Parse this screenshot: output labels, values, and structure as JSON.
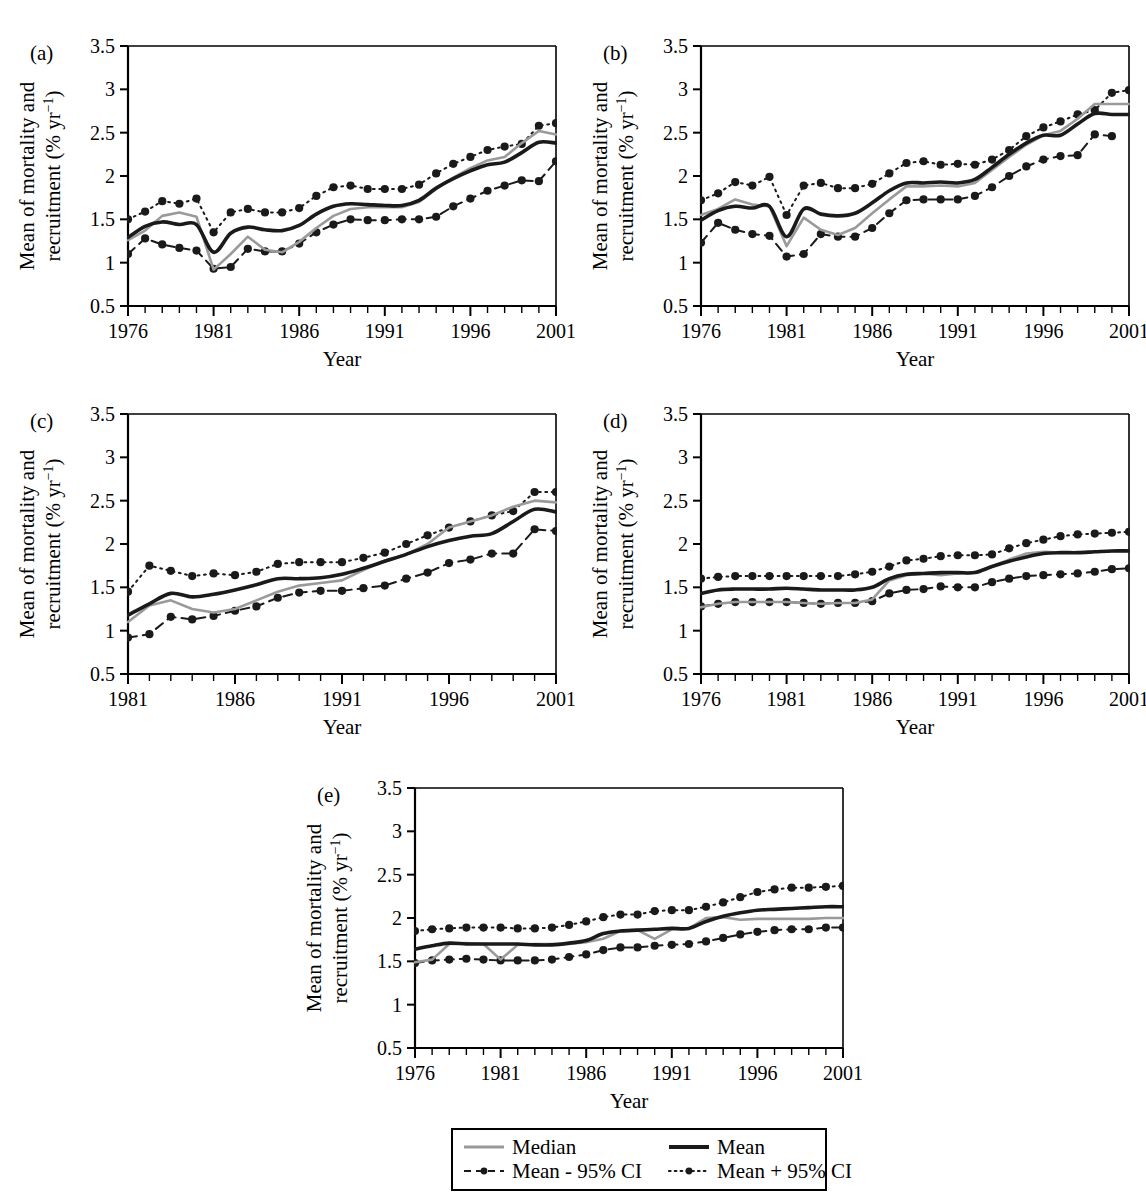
{
  "figure": {
    "axis_titles": {
      "x": "Year",
      "y_line1": "Mean of mortality and",
      "y_line2": "recruitment (% yr",
      "y_sup": "−1",
      "y_close": ")"
    },
    "colors": {
      "mean": "#1a1a1a",
      "median": "#9a9a9a",
      "ci_lower": "#1a1a1a",
      "ci_upper": "#1a1a1a",
      "axis": "#000000",
      "background": "#ffffff"
    },
    "legend": {
      "entries": [
        {
          "label": "Median",
          "style": "solid-gray",
          "marker": "none",
          "color": "#9a9a9a"
        },
        {
          "label": "Mean",
          "style": "solid-black",
          "marker": "none",
          "color": "#1a1a1a"
        },
        {
          "label": "Mean - 95% CI",
          "style": "dashed",
          "marker": "dot",
          "color": "#1a1a1a"
        },
        {
          "label": "Mean + 95% CI",
          "style": "dotted",
          "marker": "dot",
          "color": "#1a1a1a"
        }
      ]
    },
    "y_ticks": [
      0.5,
      1,
      1.5,
      2,
      2.5,
      3,
      3.5
    ],
    "y_tick_labels": [
      "0.5",
      "1",
      "1.5",
      "2",
      "2.5",
      "3",
      "3.5"
    ]
  },
  "chart_data": [
    {
      "id": "a",
      "panel_label": "(a)",
      "type": "line",
      "title": "",
      "xlabel": "Year",
      "ylabel": "Mean of mortality and recruitment (% yr−1)",
      "xlim": [
        1976,
        2001
      ],
      "ylim": [
        0.5,
        3.5
      ],
      "x_tick_labels": [
        "1976",
        "1981",
        "1986",
        "1991",
        "1996",
        "2001"
      ],
      "x_tick_values": [
        1976,
        1981,
        1986,
        1991,
        1996,
        2001
      ],
      "grid": false,
      "legend_position": "figure-bottom",
      "x": [
        1976,
        1977,
        1978,
        1979,
        1980,
        1981,
        1982,
        1983,
        1984,
        1985,
        1986,
        1987,
        1988,
        1989,
        1990,
        1991,
        1992,
        1993,
        1994,
        1995,
        1996,
        1997,
        1998,
        1999,
        2000,
        2001
      ],
      "series": [
        {
          "name": "Mean",
          "style": "solid-black",
          "values": [
            1.29,
            1.42,
            1.47,
            1.44,
            1.44,
            1.12,
            1.34,
            1.41,
            1.38,
            1.37,
            1.43,
            1.56,
            1.65,
            1.68,
            1.67,
            1.66,
            1.66,
            1.72,
            1.86,
            1.97,
            2.06,
            2.13,
            2.16,
            2.27,
            2.39,
            2.38
          ]
        },
        {
          "name": "Median",
          "style": "solid-gray",
          "values": [
            1.26,
            1.37,
            1.54,
            1.58,
            1.53,
            0.92,
            1.1,
            1.3,
            1.15,
            1.12,
            1.24,
            1.4,
            1.54,
            1.62,
            1.64,
            1.64,
            1.64,
            1.7,
            1.85,
            1.98,
            2.09,
            2.18,
            2.22,
            2.38,
            2.52,
            2.48
          ]
        },
        {
          "name": "Mean - 95% CI",
          "style": "dashed",
          "marker": "dot",
          "values": [
            1.1,
            1.28,
            1.21,
            1.17,
            1.14,
            0.93,
            0.95,
            1.16,
            1.13,
            1.13,
            1.22,
            1.35,
            1.44,
            1.5,
            1.49,
            1.49,
            1.5,
            1.5,
            1.53,
            1.65,
            1.74,
            1.83,
            1.89,
            1.95,
            1.94,
            2.17,
            2.17
          ]
        },
        {
          "name": "Mean + 95% CI",
          "style": "dotted",
          "marker": "dot",
          "values": [
            1.5,
            1.59,
            1.71,
            1.68,
            1.74,
            1.35,
            1.58,
            1.62,
            1.58,
            1.58,
            1.63,
            1.77,
            1.87,
            1.89,
            1.85,
            1.85,
            1.85,
            1.9,
            2.03,
            2.14,
            2.22,
            2.3,
            2.34,
            2.37,
            2.58,
            2.61
          ]
        }
      ]
    },
    {
      "id": "b",
      "panel_label": "(b)",
      "type": "line",
      "title": "",
      "xlabel": "Year",
      "ylabel": "Mean of mortality and recruitment (% yr−1)",
      "xlim": [
        1976,
        2001
      ],
      "ylim": [
        0.5,
        3.5
      ],
      "x_tick_labels": [
        "1976",
        "1981",
        "1986",
        "1991",
        "1996",
        "2001"
      ],
      "x_tick_values": [
        1976,
        1981,
        1986,
        1991,
        1996,
        2001
      ],
      "grid": false,
      "legend_position": "figure-bottom",
      "x": [
        1976,
        1977,
        1978,
        1979,
        1980,
        1981,
        1982,
        1983,
        1984,
        1985,
        1986,
        1987,
        1988,
        1989,
        1990,
        1991,
        1992,
        1993,
        1994,
        1995,
        1996,
        1997,
        1998,
        1999,
        2000,
        2001
      ],
      "series": [
        {
          "name": "Mean",
          "style": "solid-black",
          "values": [
            1.49,
            1.6,
            1.65,
            1.63,
            1.65,
            1.3,
            1.62,
            1.56,
            1.54,
            1.57,
            1.69,
            1.83,
            1.92,
            1.92,
            1.93,
            1.92,
            1.96,
            2.1,
            2.25,
            2.38,
            2.47,
            2.47,
            2.6,
            2.72,
            2.71,
            2.71
          ]
        },
        {
          "name": "Median",
          "style": "solid-gray",
          "values": [
            1.55,
            1.62,
            1.73,
            1.67,
            1.65,
            1.19,
            1.52,
            1.38,
            1.32,
            1.4,
            1.57,
            1.73,
            1.88,
            1.88,
            1.89,
            1.88,
            1.92,
            2.07,
            2.22,
            2.36,
            2.47,
            2.52,
            2.66,
            2.83,
            2.83,
            2.83
          ]
        },
        {
          "name": "Mean - 95% CI",
          "style": "dashed",
          "marker": "dot",
          "values": [
            1.23,
            1.46,
            1.38,
            1.33,
            1.31,
            1.07,
            1.1,
            1.33,
            1.3,
            1.3,
            1.4,
            1.57,
            1.72,
            1.73,
            1.73,
            1.73,
            1.77,
            1.87,
            2.0,
            2.11,
            2.19,
            2.23,
            2.24,
            2.48,
            2.46
          ]
        },
        {
          "name": "Mean + 95% CI",
          "style": "dotted",
          "marker": "dot",
          "values": [
            1.72,
            1.8,
            1.93,
            1.89,
            1.99,
            1.55,
            1.89,
            1.92,
            1.86,
            1.86,
            1.91,
            2.03,
            2.15,
            2.17,
            2.13,
            2.14,
            2.13,
            2.19,
            2.3,
            2.46,
            2.56,
            2.63,
            2.71,
            2.76,
            2.96,
            2.99
          ]
        }
      ]
    },
    {
      "id": "c",
      "panel_label": "(c)",
      "type": "line",
      "title": "",
      "xlabel": "Year",
      "ylabel": "Mean of mortality and recruitment (% yr−1)",
      "xlim": [
        1981,
        2001
      ],
      "ylim": [
        0.5,
        3.5
      ],
      "x_tick_labels": [
        "1981",
        "1986",
        "1991",
        "1996",
        "2001"
      ],
      "x_tick_values": [
        1981,
        1986,
        1991,
        1996,
        2001
      ],
      "grid": false,
      "legend_position": "figure-bottom",
      "x": [
        1981,
        1982,
        1983,
        1984,
        1985,
        1986,
        1987,
        1988,
        1989,
        1990,
        1991,
        1992,
        1993,
        1994,
        1995,
        1996,
        1997,
        1998,
        1999,
        2000,
        2001
      ],
      "series": [
        {
          "name": "Mean",
          "style": "solid-black",
          "values": [
            1.18,
            1.31,
            1.43,
            1.39,
            1.42,
            1.47,
            1.53,
            1.6,
            1.6,
            1.61,
            1.65,
            1.72,
            1.8,
            1.88,
            1.97,
            2.04,
            2.09,
            2.12,
            2.26,
            2.4,
            2.37
          ]
        },
        {
          "name": "Median",
          "style": "solid-gray",
          "values": [
            1.1,
            1.29,
            1.35,
            1.25,
            1.21,
            1.25,
            1.35,
            1.45,
            1.52,
            1.55,
            1.58,
            1.7,
            1.81,
            1.88,
            2.0,
            2.19,
            2.26,
            2.33,
            2.43,
            2.5,
            2.48
          ]
        },
        {
          "name": "Mean - 95% CI",
          "style": "dashed",
          "marker": "dot",
          "values": [
            0.92,
            0.96,
            1.16,
            1.13,
            1.17,
            1.23,
            1.28,
            1.38,
            1.44,
            1.46,
            1.46,
            1.49,
            1.52,
            1.6,
            1.67,
            1.78,
            1.82,
            1.89,
            1.89,
            2.17,
            2.15
          ]
        },
        {
          "name": "Mean + 95% CI",
          "style": "dotted",
          "marker": "dot",
          "values": [
            1.45,
            1.75,
            1.69,
            1.63,
            1.66,
            1.64,
            1.68,
            1.77,
            1.79,
            1.79,
            1.79,
            1.84,
            1.9,
            2.0,
            2.1,
            2.19,
            2.26,
            2.33,
            2.38,
            2.6,
            2.6
          ]
        }
      ]
    },
    {
      "id": "d",
      "panel_label": "(d)",
      "type": "line",
      "title": "",
      "xlabel": "Year",
      "ylabel": "Mean of mortality and recruitment (% yr−1)",
      "xlim": [
        1976,
        2001
      ],
      "ylim": [
        0.5,
        3.5
      ],
      "x_tick_labels": [
        "1976",
        "1981",
        "1986",
        "1991",
        "1996",
        "2001"
      ],
      "x_tick_values": [
        1976,
        1981,
        1986,
        1991,
        1996,
        2001
      ],
      "grid": false,
      "legend_position": "figure-bottom",
      "x": [
        1976,
        1977,
        1978,
        1979,
        1980,
        1981,
        1982,
        1983,
        1984,
        1985,
        1986,
        1987,
        1988,
        1989,
        1990,
        1991,
        1992,
        1993,
        1994,
        1995,
        1996,
        1997,
        1998,
        1999,
        2000,
        2001
      ],
      "series": [
        {
          "name": "Mean",
          "style": "solid-black",
          "values": [
            1.43,
            1.47,
            1.48,
            1.48,
            1.48,
            1.49,
            1.48,
            1.47,
            1.47,
            1.47,
            1.5,
            1.6,
            1.65,
            1.66,
            1.67,
            1.67,
            1.67,
            1.74,
            1.8,
            1.85,
            1.89,
            1.9,
            1.9,
            1.91,
            1.92,
            1.92
          ]
        },
        {
          "name": "Median",
          "style": "solid-gray",
          "values": [
            1.27,
            1.31,
            1.33,
            1.33,
            1.33,
            1.33,
            1.32,
            1.31,
            1.32,
            1.32,
            1.36,
            1.58,
            1.64,
            1.66,
            1.64,
            1.66,
            1.67,
            1.74,
            1.82,
            1.89,
            1.91,
            1.9,
            1.9,
            1.91,
            1.92,
            1.92
          ]
        },
        {
          "name": "Mean - 95% CI",
          "style": "dashed",
          "marker": "dot",
          "values": [
            1.28,
            1.31,
            1.33,
            1.33,
            1.33,
            1.33,
            1.32,
            1.31,
            1.32,
            1.32,
            1.34,
            1.43,
            1.47,
            1.48,
            1.51,
            1.5,
            1.5,
            1.56,
            1.6,
            1.63,
            1.64,
            1.65,
            1.66,
            1.68,
            1.71,
            1.72
          ]
        },
        {
          "name": "Mean + 95% CI",
          "style": "dotted",
          "marker": "dot",
          "values": [
            1.6,
            1.62,
            1.63,
            1.63,
            1.63,
            1.63,
            1.63,
            1.63,
            1.63,
            1.65,
            1.68,
            1.74,
            1.81,
            1.83,
            1.86,
            1.87,
            1.87,
            1.88,
            1.95,
            2.01,
            2.05,
            2.09,
            2.11,
            2.12,
            2.13,
            2.14
          ]
        }
      ]
    },
    {
      "id": "e",
      "panel_label": "(e)",
      "type": "line",
      "title": "",
      "xlabel": "Year",
      "ylabel": "Mean of mortality and recruitment (% yr−1)",
      "xlim": [
        1976,
        2001
      ],
      "ylim": [
        0.5,
        3.5
      ],
      "x_tick_labels": [
        "1976",
        "1981",
        "1986",
        "1991",
        "1996",
        "2001"
      ],
      "x_tick_values": [
        1976,
        1981,
        1986,
        1991,
        1996,
        2001
      ],
      "grid": false,
      "legend_position": "figure-bottom",
      "x": [
        1976,
        1977,
        1978,
        1979,
        1980,
        1981,
        1982,
        1983,
        1984,
        1985,
        1986,
        1987,
        1988,
        1989,
        1990,
        1991,
        1992,
        1993,
        1994,
        1995,
        1996,
        1997,
        1998,
        1999,
        2000,
        2001
      ],
      "series": [
        {
          "name": "Mean",
          "style": "solid-black",
          "values": [
            1.64,
            1.68,
            1.71,
            1.7,
            1.7,
            1.7,
            1.7,
            1.69,
            1.69,
            1.71,
            1.74,
            1.82,
            1.85,
            1.86,
            1.87,
            1.88,
            1.88,
            1.96,
            2.02,
            2.06,
            2.09,
            2.1,
            2.11,
            2.12,
            2.13,
            2.13
          ]
        },
        {
          "name": "Median",
          "style": "solid-gray",
          "values": [
            1.49,
            1.52,
            1.7,
            1.71,
            1.7,
            1.52,
            1.69,
            1.7,
            1.7,
            1.7,
            1.72,
            1.76,
            1.85,
            1.86,
            1.76,
            1.87,
            1.88,
            2.0,
            2.01,
            1.98,
            1.99,
            1.99,
            1.99,
            1.99,
            2.0,
            2.0
          ]
        },
        {
          "name": "Mean - 95% CI",
          "style": "dashed",
          "marker": "dot",
          "values": [
            1.48,
            1.51,
            1.52,
            1.53,
            1.52,
            1.51,
            1.51,
            1.51,
            1.52,
            1.55,
            1.58,
            1.63,
            1.66,
            1.66,
            1.68,
            1.69,
            1.7,
            1.73,
            1.77,
            1.81,
            1.84,
            1.86,
            1.87,
            1.87,
            1.89,
            1.89
          ]
        },
        {
          "name": "Mean + 95% CI",
          "style": "dotted",
          "marker": "dot",
          "values": [
            1.85,
            1.87,
            1.88,
            1.89,
            1.89,
            1.89,
            1.88,
            1.88,
            1.89,
            1.92,
            1.96,
            2.01,
            2.04,
            2.04,
            2.08,
            2.09,
            2.09,
            2.13,
            2.18,
            2.24,
            2.3,
            2.33,
            2.35,
            2.35,
            2.36,
            2.37
          ]
        }
      ]
    }
  ]
}
